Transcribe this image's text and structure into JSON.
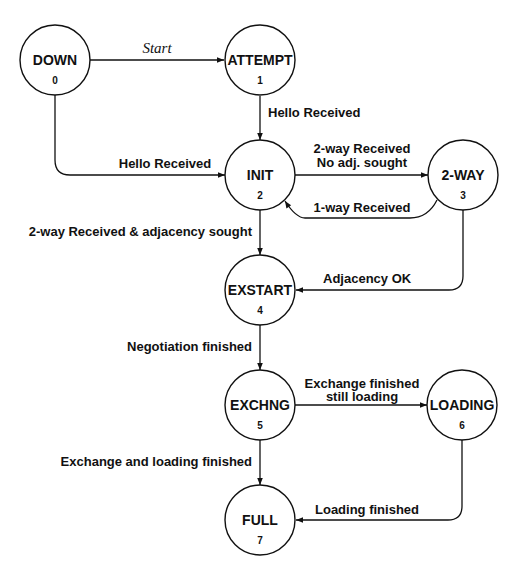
{
  "diagram": {
    "nodes": [
      {
        "id": "down",
        "label": "DOWN",
        "number": "0",
        "cx": 55,
        "cy": 60
      },
      {
        "id": "attempt",
        "label": "ATTEMPT",
        "number": "1",
        "cx": 260,
        "cy": 60
      },
      {
        "id": "init",
        "label": "INIT",
        "number": "2",
        "cx": 260,
        "cy": 175
      },
      {
        "id": "two_way",
        "label": "2-WAY",
        "number": "3",
        "cx": 463,
        "cy": 175
      },
      {
        "id": "exstart",
        "label": "EXSTART",
        "number": "4",
        "cx": 260,
        "cy": 290
      },
      {
        "id": "exchng",
        "label": "EXCHNG",
        "number": "5",
        "cx": 260,
        "cy": 405
      },
      {
        "id": "loading",
        "label": "LOADING",
        "number": "6",
        "cx": 462,
        "cy": 405
      },
      {
        "id": "full",
        "label": "FULL",
        "number": "7",
        "cx": 260,
        "cy": 520
      }
    ],
    "edges": [
      {
        "from": "DOWN",
        "to": "ATTEMPT",
        "label": "Start"
      },
      {
        "from": "ATTEMPT",
        "to": "INIT",
        "label": "Hello Received"
      },
      {
        "from": "DOWN",
        "to": "INIT",
        "label": "Hello Received"
      },
      {
        "from": "INIT",
        "to": "2-WAY",
        "label_line1": "2-way Received",
        "label_line2": "No adj. sought"
      },
      {
        "from": "2-WAY",
        "to": "INIT",
        "label": "1-way Received"
      },
      {
        "from": "INIT",
        "to": "EXSTART",
        "label": "2-way Received & adjacency sought"
      },
      {
        "from": "2-WAY",
        "to": "EXSTART",
        "label": "Adjacency OK"
      },
      {
        "from": "EXSTART",
        "to": "EXCHNG",
        "label": "Negotiation finished"
      },
      {
        "from": "EXCHNG",
        "to": "LOADING",
        "label_line1": "Exchange finished",
        "label_line2": "still loading"
      },
      {
        "from": "EXCHNG",
        "to": "FULL",
        "label": "Exchange and loading finished"
      },
      {
        "from": "LOADING",
        "to": "FULL",
        "label": "Loading finished"
      }
    ],
    "style": {
      "stroke_color": "#111111",
      "background": "#ffffff",
      "node_radius": 35
    }
  }
}
